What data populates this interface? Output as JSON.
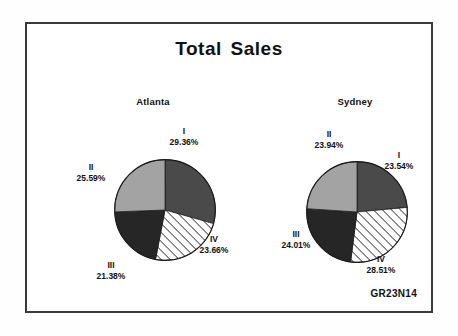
{
  "figure": {
    "title": "Total Sales",
    "code": "GR23N14"
  },
  "chart_data": [
    {
      "type": "pie",
      "title": "Atlanta",
      "categories": [
        "I",
        "II",
        "III",
        "IV"
      ],
      "values": [
        29.36,
        25.59,
        21.38,
        23.66
      ],
      "labels": [
        "29.36%",
        "25.59%",
        "21.38%",
        "23.66%"
      ],
      "colors": [
        "#4a4a4a",
        "#a3a3a3",
        "#262626",
        "#ffffff"
      ],
      "fills": [
        "solid-dark-gray",
        "solid-light-gray",
        "solid-black",
        "diagonal-hatch"
      ],
      "start_angle_deg": 0,
      "direction": "clockwise",
      "legend": "none",
      "xlabel": "",
      "ylabel": ""
    },
    {
      "type": "pie",
      "title": "Sydney",
      "categories": [
        "I",
        "II",
        "III",
        "IV"
      ],
      "values": [
        23.54,
        23.94,
        24.01,
        28.51
      ],
      "labels": [
        "23.54%",
        "23.94%",
        "24.01%",
        "28.51%"
      ],
      "colors": [
        "#4a4a4a",
        "#a3a3a3",
        "#262626",
        "#ffffff"
      ],
      "fills": [
        "solid-dark-gray",
        "solid-light-gray",
        "solid-black",
        "diagonal-hatch"
      ],
      "start_angle_deg": 0,
      "direction": "clockwise",
      "legend": "none",
      "xlabel": "",
      "ylabel": ""
    }
  ],
  "atlanta": {
    "title": "Atlanta",
    "slices": [
      {
        "roman": "I",
        "pct": "29.36%"
      },
      {
        "roman": "II",
        "pct": "25.59%"
      },
      {
        "roman": "III",
        "pct": "21.38%"
      },
      {
        "roman": "IV",
        "pct": "23.66%"
      }
    ]
  },
  "sydney": {
    "title": "Sydney",
    "slices": [
      {
        "roman": "I",
        "pct": "23.54%"
      },
      {
        "roman": "II",
        "pct": "23.94%"
      },
      {
        "roman": "III",
        "pct": "24.01%"
      },
      {
        "roman": "IV",
        "pct": "28.51%"
      }
    ]
  }
}
